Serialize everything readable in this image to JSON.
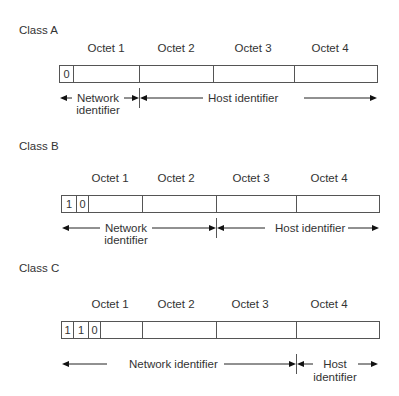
{
  "diagram": {
    "classes": [
      {
        "title": "Class A",
        "octets": [
          "Octet 1",
          "Octet 2",
          "Octet 3",
          "Octet 4"
        ],
        "prefix_bits": [
          "0"
        ],
        "network_label": [
          "Network",
          "identifier"
        ],
        "host_label": [
          "Host identifier"
        ],
        "boundary_after_octet": 1
      },
      {
        "title": "Class B",
        "octets": [
          "Octet 1",
          "Octet 2",
          "Octet 3",
          "Octet 4"
        ],
        "prefix_bits": [
          "1",
          "0"
        ],
        "network_label": [
          "Network",
          "identifier"
        ],
        "host_label": [
          "Host identifier"
        ],
        "boundary_after_octet": 2
      },
      {
        "title": "Class C",
        "octets": [
          "Octet 1",
          "Octet 2",
          "Octet 3",
          "Octet 4"
        ],
        "prefix_bits": [
          "1",
          "1",
          "0"
        ],
        "network_label": [
          "Network identifier"
        ],
        "host_label": [
          "Host",
          "identifier"
        ],
        "boundary_after_octet": 3
      }
    ],
    "colors": {
      "text": "#333333",
      "lines": "#555555",
      "background": "#ffffff"
    }
  }
}
